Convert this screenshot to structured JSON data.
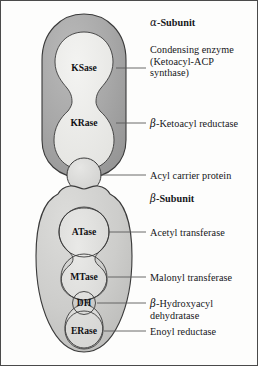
{
  "figure": {
    "background": "#fdfdfc",
    "frame_color": "#4a4a4a"
  },
  "colors": {
    "alpha_outer_fill": "#a9a9a9",
    "alpha_inner_fill": "#ececea",
    "beta_fill": "#cfcfcd",
    "domain_fill": "#dededc",
    "acp_fill": "#dcdcda",
    "outline": "#3a3a3a",
    "leader_line": "#5a5a5a",
    "text": "#16161a"
  },
  "subunits": [
    {
      "id": "alpha",
      "label_greek": "α",
      "label_rest": "-Subunit",
      "label_x": 150,
      "label_y": 22
    },
    {
      "id": "beta",
      "label_greek": "β",
      "label_rest": "-Subunit",
      "label_x": 150,
      "label_y": 196
    }
  ],
  "domains": [
    {
      "id": "ksase",
      "inner_label": "KSase",
      "cx": 84,
      "cy": 68
    },
    {
      "id": "krase",
      "inner_label": "KRase",
      "cx": 84,
      "cy": 123
    },
    {
      "id": "acp",
      "inner_label": "",
      "cx": 84,
      "cy": 175
    },
    {
      "id": "atase",
      "inner_label": "ATase",
      "cx": 84,
      "cy": 232
    },
    {
      "id": "mtase",
      "inner_label": "MTase",
      "cx": 84,
      "cy": 275
    },
    {
      "id": "dh",
      "inner_label": "DH",
      "cx": 84,
      "cy": 303
    },
    {
      "id": "erase",
      "inner_label": "ERase",
      "cx": 84,
      "cy": 333
    }
  ],
  "callouts": [
    {
      "id": "condensing-enzyme",
      "target": "ksase",
      "lines": [
        "Condensing enzyme",
        "(Ketoacyl-ACP",
        "synthase)"
      ],
      "greek_prefix": "",
      "leader_y": 68,
      "leader_x1": 116,
      "leader_x2": 146,
      "text_x": 150,
      "text_y": 48
    },
    {
      "id": "ketoacyl-reductase",
      "target": "krase",
      "lines": [
        "-Ketoacyl reductase"
      ],
      "greek_prefix": "β",
      "leader_y": 123,
      "leader_x1": 116,
      "leader_x2": 146,
      "text_x": 150,
      "text_y": 118
    },
    {
      "id": "acyl-carrier-protein",
      "target": "acp",
      "lines": [
        "Acyl carrier protein"
      ],
      "greek_prefix": "",
      "leader_y": 175,
      "leader_x1": 100,
      "leader_x2": 146,
      "text_x": 150,
      "text_y": 170
    },
    {
      "id": "acetyl-transferase",
      "target": "atase",
      "lines": [
        "Acetyl transferase"
      ],
      "greek_prefix": "",
      "leader_y": 232,
      "leader_x1": 108,
      "leader_x2": 146,
      "text_x": 150,
      "text_y": 227
    },
    {
      "id": "malonyl-transferase",
      "target": "mtase",
      "lines": [
        "Malonyl transferase"
      ],
      "greek_prefix": "",
      "leader_y": 275,
      "leader_x1": 108,
      "leader_x2": 146,
      "text_x": 150,
      "text_y": 270
    },
    {
      "id": "hydroxyacyl-dehydratase",
      "target": "dh",
      "lines": [
        "-Hydroxyacyl",
        "dehydratase"
      ],
      "greek_prefix": "β",
      "leader_y": 303,
      "leader_x1": 98,
      "leader_x2": 146,
      "text_x": 150,
      "text_y": 298
    },
    {
      "id": "enoyl-reductase",
      "target": "erase",
      "lines": [
        "Enoyl reductase"
      ],
      "greek_prefix": "",
      "leader_y": 333,
      "leader_x1": 106,
      "leader_x2": 146,
      "text_x": 150,
      "text_y": 328
    }
  ]
}
